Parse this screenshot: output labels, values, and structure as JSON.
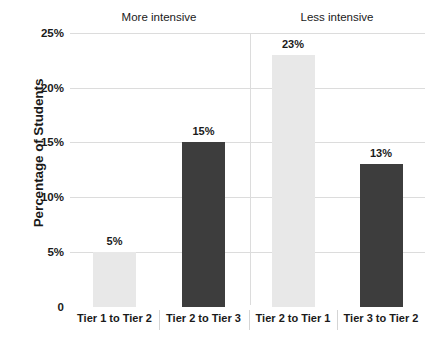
{
  "chart_data": {
    "type": "bar",
    "title": "",
    "xlabel": "",
    "ylabel": "Percentage of Students",
    "ylim": [
      0,
      25
    ],
    "grid": true,
    "legend": "none",
    "categories": [
      "Tier 1 to Tier 2",
      "Tier 2 to Tier 3",
      "Tier 2 to Tier 1",
      "Tier 3 to Tier 2"
    ],
    "values": [
      5,
      15,
      23,
      13
    ],
    "data_labels": [
      "5%",
      "15%",
      "23%",
      "13%"
    ],
    "bar_colors": [
      "#e8e8e8",
      "#3d3d3d",
      "#e8e8e8",
      "#3d3d3d"
    ],
    "y_ticks": [
      {
        "value": 25,
        "label": "25%"
      },
      {
        "value": 20,
        "label": "20%"
      },
      {
        "value": 15,
        "label": "15%"
      },
      {
        "value": 10,
        "label": "10%"
      },
      {
        "value": 5,
        "label": "5%"
      },
      {
        "value": 0,
        "label": "0"
      }
    ],
    "groups": [
      {
        "label": "More intensive",
        "categories": [
          "Tier 1 to Tier 2",
          "Tier 2 to Tier 3"
        ]
      },
      {
        "label": "Less intensive",
        "categories": [
          "Tier 2 to Tier 1",
          "Tier 3 to Tier 2"
        ]
      }
    ],
    "annotations": []
  },
  "colors": {
    "light_bar": "#e8e8e8",
    "dark_bar": "#3d3d3d",
    "gridline": "#dcdcdc",
    "text": "#1a1a1a",
    "background": "#ffffff"
  }
}
